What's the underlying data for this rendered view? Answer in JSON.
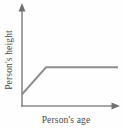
{
  "chart_data": {
    "type": "line",
    "title": "",
    "subtitle": "",
    "xlabel": "Person's age",
    "ylabel": "Person's height",
    "xticklabels": [],
    "yticklabels": [],
    "grid": false,
    "legend": null,
    "legend_position": "none",
    "xlim": [
      0,
      100
    ],
    "ylim": [
      0,
      100
    ],
    "annotations": [],
    "series": [
      {
        "name": "height vs age",
        "x": [
          0,
          25,
          100
        ],
        "y": [
          13,
          43,
          43
        ],
        "description": "Height rises linearly from a low starting value during childhood, then plateaus at adult height and stays constant.",
        "color": "#8d8d8d"
      }
    ]
  },
  "axes": {
    "x_axis_arrow": "right-arrow-icon",
    "y_axis_arrow": "up-arrow-icon",
    "axis_color": "#8a8a8a"
  },
  "figure": {
    "background": "#fefefe",
    "line_color": "#8d8d8d",
    "text_color": "#4a4a4a"
  }
}
